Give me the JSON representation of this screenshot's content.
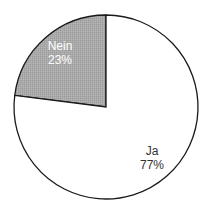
{
  "chart_data": {
    "type": "pie",
    "title": "",
    "categories": [
      "Nein",
      "Ja"
    ],
    "values": [
      23,
      77
    ],
    "unit": "%",
    "labels": [
      "Nein\n23%",
      "Ja\n77%"
    ],
    "start_angle_deg": 0,
    "direction": "counterclockwise-from-top for Nein",
    "legend": "none",
    "colors": {
      "Nein": "#a9a9a9",
      "Ja": "#ffffff",
      "outline": "#1a1a1a",
      "label_on_dark": "#ffffff",
      "label_on_light": "#333333"
    }
  },
  "slices": [
    {
      "name": "Nein",
      "value_text": "23%",
      "color": "#a9a9a9",
      "text_color": "#ffffff"
    },
    {
      "name": "Ja",
      "value_text": "77%",
      "color": "#ffffff",
      "text_color": "#333333"
    }
  ],
  "geometry": {
    "cx": 106,
    "cy": 107,
    "r": 92
  }
}
